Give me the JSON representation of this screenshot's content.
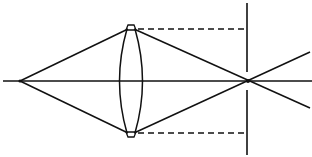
{
  "diagram": {
    "type": "optics-ray-diagram",
    "colors": {
      "stroke": "#111111",
      "background": "#ffffff"
    },
    "elements": {
      "optical_axis": {
        "x1": 3,
        "y1": 81,
        "x2": 312,
        "y2": 81
      },
      "object_point": {
        "x": 20,
        "y": 81
      },
      "image_point": {
        "x": 248,
        "y": 81
      },
      "lens": {
        "center_x": 131,
        "top_y": 28,
        "bottom_y": 134,
        "half_width": 12
      },
      "screen": {
        "x": 247,
        "top_y": 3,
        "bottom_y": 155
      },
      "dashed_top": {
        "x1": 137,
        "y1": 29,
        "x2": 247,
        "y2": 29
      },
      "dashed_bottom": {
        "x1": 137,
        "y1": 133,
        "x2": 247,
        "y2": 133
      }
    }
  }
}
